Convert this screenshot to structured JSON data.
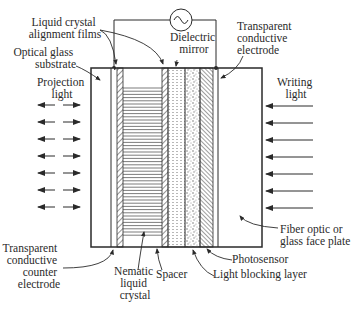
{
  "diagram": {
    "labels": {
      "lc_alignment_films": [
        "Liquid crystal",
        "alignment films"
      ],
      "optical_glass": [
        "Optical glass",
        "substrate"
      ],
      "projection_light": [
        "Projection",
        "light"
      ],
      "dielectric_mirror": [
        "Dielectric",
        "mirror"
      ],
      "transparent_electrode": [
        "Transparent",
        "conductive",
        "electrode"
      ],
      "writing_light": [
        "Writing",
        "light"
      ],
      "counter_electrode": [
        "Transparent",
        "conductive",
        "counter",
        "electrode"
      ],
      "nematic_lc": [
        "Nematic",
        "liquid",
        "crystal"
      ],
      "spacer": "Spacer",
      "photosensor": "Photosensor",
      "light_blocking": "Light blocking layer",
      "face_plate": [
        "Fiber optic or",
        "glass face plate"
      ]
    },
    "icons": {
      "ac_source": "ac-source-icon"
    },
    "colors": {
      "line": "#2a2a2a",
      "background": "#ffffff"
    }
  }
}
